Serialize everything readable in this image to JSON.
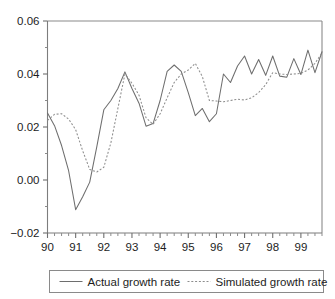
{
  "chart_data": {
    "type": "line",
    "title": "",
    "subtitle": "",
    "xlabel": "",
    "ylabel": "",
    "xlim": [
      1990.0,
      1999.75
    ],
    "ylim": [
      -0.02,
      0.06
    ],
    "grid": false,
    "legend_position": "below-plot",
    "y_ticks": [
      "0.06",
      "0.04",
      "0.02",
      "0.00",
      "-0.02"
    ],
    "y_tick_values": [
      0.06,
      0.04,
      0.02,
      0.0,
      -0.02
    ],
    "x_ticks": [
      "90",
      "91",
      "92",
      "93",
      "94",
      "95",
      "96",
      "97",
      "98",
      "99"
    ],
    "x_tick_values": [
      1990,
      1991,
      1992,
      1993,
      1994,
      1995,
      1996,
      1997,
      1998,
      1999
    ],
    "x_minor_per_major": 4,
    "x": [
      1990.0,
      1990.25,
      1990.5,
      1990.75,
      1991.0,
      1991.25,
      1991.5,
      1991.75,
      1992.0,
      1992.25,
      1992.5,
      1992.75,
      1993.0,
      1993.25,
      1993.5,
      1993.75,
      1994.0,
      1994.25,
      1994.5,
      1994.75,
      1995.0,
      1995.25,
      1995.5,
      1995.75,
      1996.0,
      1996.25,
      1996.5,
      1996.75,
      1997.0,
      1997.25,
      1997.5,
      1997.75,
      1998.0,
      1998.25,
      1998.5,
      1998.75,
      1999.0,
      1999.25,
      1999.5,
      1999.75
    ],
    "series": [
      {
        "name": "Actual growth rate",
        "style": "solid",
        "color": "#6e6e6e",
        "values": [
          0.0253,
          0.0205,
          0.013,
          0.0035,
          -0.0112,
          -0.0063,
          -0.0008,
          0.0125,
          0.0265,
          0.03,
          0.0345,
          0.0408,
          0.0345,
          0.029,
          0.0203,
          0.0213,
          0.03,
          0.041,
          0.0434,
          0.041,
          0.033,
          0.0243,
          0.027,
          0.022,
          0.025,
          0.04,
          0.0368,
          0.043,
          0.0468,
          0.04,
          0.0455,
          0.0395,
          0.0468,
          0.0392,
          0.0388,
          0.0458,
          0.0398,
          0.049,
          0.0405,
          0.0484
        ]
      },
      {
        "name": "Simulated growth rate",
        "style": "dotted",
        "color": "#8d8d8d",
        "values": [
          0.0225,
          0.0248,
          0.025,
          0.023,
          0.019,
          0.011,
          0.004,
          0.003,
          0.0048,
          0.014,
          0.027,
          0.04,
          0.0365,
          0.032,
          0.0235,
          0.021,
          0.025,
          0.031,
          0.0368,
          0.04,
          0.0415,
          0.044,
          0.039,
          0.03,
          0.0298,
          0.0295,
          0.03,
          0.0305,
          0.0302,
          0.031,
          0.033,
          0.036,
          0.0405,
          0.04,
          0.0398,
          0.04,
          0.0402,
          0.0415,
          0.044,
          0.048
        ]
      }
    ]
  },
  "legend": {
    "items": [
      {
        "label": "Actual growth rate",
        "style": "solid"
      },
      {
        "label": "Simulated growth rate",
        "style": "dotted"
      }
    ]
  }
}
